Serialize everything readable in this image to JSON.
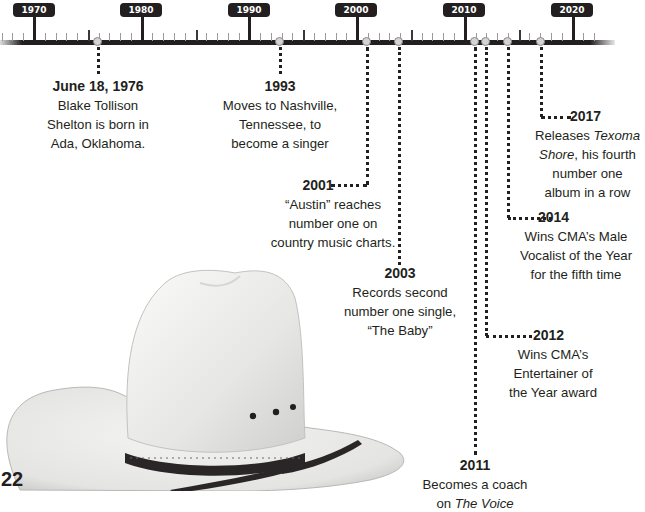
{
  "timeline": {
    "axis_start_year": 1970,
    "axis_end_year": 2020,
    "decade_labels": [
      "1970",
      "1980",
      "1990",
      "2000",
      "2010",
      "2020"
    ],
    "colors": {
      "axis": "#231f20",
      "label_bg": "#231f20",
      "label_text": "#ffffff",
      "marker_fill": "#d4d4d4"
    }
  },
  "events": [
    {
      "date": "June 18, 1976",
      "lines": [
        "Blake Tollison",
        "Shelton is born in",
        "Ada, Oklahoma."
      ]
    },
    {
      "date": "1993",
      "lines": [
        "Moves to Nashville,",
        "Tennessee, to",
        "become a singer"
      ]
    },
    {
      "date": "2001",
      "lines": [
        "“Austin” reaches",
        "number one on",
        "country music charts."
      ]
    },
    {
      "date": "2003",
      "lines": [
        "Records second",
        "number one single,",
        "“The Baby”"
      ]
    },
    {
      "date": "2011",
      "line1": "Becomes a coach",
      "line2_prefix": "on ",
      "line2_italic": "The Voice"
    },
    {
      "date": "2012",
      "lines": [
        "Wins CMA’s",
        "Entertainer of",
        "the Year award"
      ]
    },
    {
      "date": "2014",
      "lines": [
        "Wins CMA’s Male",
        "Vocalist of the Year",
        "for the fifth time"
      ]
    },
    {
      "date": "2017",
      "line1_prefix": "Releases ",
      "line1_italic": "Texoma",
      "line2_italic": "Shore",
      "line2_suffix": ", his fourth",
      "line3": "number one",
      "line4": "album in a row"
    }
  ],
  "illustration": {
    "subject": "white cowboy hat with dark braided band"
  },
  "page_number": "22"
}
